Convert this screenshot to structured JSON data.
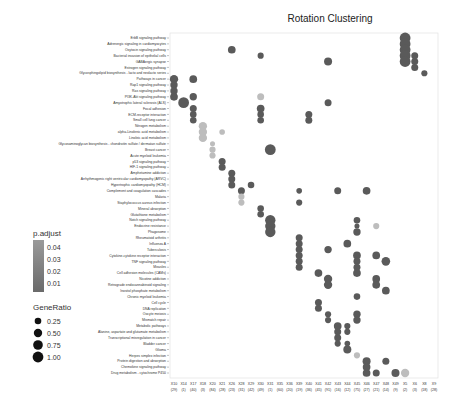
{
  "chart_data": {
    "type": "scatter",
    "title": "Rotation Clustering",
    "xlabel": "",
    "ylabel": "",
    "grid": false,
    "columns": [
      {
        "id": "X10",
        "n": "(29)"
      },
      {
        "id": "X14",
        "n": "(1)"
      },
      {
        "id": "X17",
        "n": "(40)"
      },
      {
        "id": "X18",
        "n": "(3)"
      },
      {
        "id": "X20",
        "n": "(84)"
      },
      {
        "id": "X21",
        "n": "(28)"
      },
      {
        "id": "X26",
        "n": "(23)"
      },
      {
        "id": "X28",
        "n": "(31)"
      },
      {
        "id": "X29",
        "n": "(42)"
      },
      {
        "id": "X30",
        "n": "(49)"
      },
      {
        "id": "X31",
        "n": "(1)"
      },
      {
        "id": "X35",
        "n": "(60)"
      },
      {
        "id": "X36",
        "n": "(20)"
      },
      {
        "id": "X39",
        "n": "(19)"
      },
      {
        "id": "X40",
        "n": "(36)"
      },
      {
        "id": "X41",
        "n": "(45)"
      },
      {
        "id": "X42",
        "n": "(91)"
      },
      {
        "id": "X43",
        "n": "(16)"
      },
      {
        "id": "X44",
        "n": "(12)"
      },
      {
        "id": "X45",
        "n": "(75)"
      },
      {
        "id": "X46",
        "n": "(27)"
      },
      {
        "id": "X47",
        "n": "(21)"
      },
      {
        "id": "X48",
        "n": "(14)"
      },
      {
        "id": "X49",
        "n": "(9)"
      },
      {
        "id": "X5",
        "n": "(2)"
      },
      {
        "id": "X6",
        "n": "(3)"
      },
      {
        "id": "X8",
        "n": "(18)"
      },
      {
        "id": "X9",
        "n": "(28)"
      }
    ],
    "rows": [
      "ErbB signaling pathway",
      "Adrenergic signaling in cardiomyocytes",
      "Oxytocin signaling pathway",
      "Bacterial invasion of epithelial cells",
      "GABAergic synapse",
      "Estrogen signaling pathway",
      "Glycosphingolipid biosynthesis - lacto and neolacto series",
      "Pathways in cancer",
      "Rap1 signaling pathway",
      "Ras signaling pathway",
      "PI3K-Akt signaling pathway",
      "Amyotrophic lateral sclerosis (ALS)",
      "Focal adhesion",
      "ECM-receptor interaction",
      "Small cell lung cancer",
      "Nitrogen metabolism",
      "alpha-Linolenic acid metabolism",
      "Linoleic acid metabolism",
      "Glycosaminoglycan biosynthesis - chondroitin sulfate / dermatan sulfate",
      "Breast cancer",
      "Acute myeloid leukemia",
      "p53 signaling pathway",
      "HIF-1 signaling pathway",
      "Amphetamine addiction",
      "Arrhythmogenic right ventricular cardiomyopathy (ARVC)",
      "Hypertrophic cardiomyopathy (HCM)",
      "Complement and coagulation cascades",
      "Malaria",
      "Staphylococcus aureus infection",
      "Mineral absorption",
      "Glutathione metabolism",
      "Notch signaling pathway",
      "Endocrine resistance",
      "Phagosome",
      "Rheumatoid arthritis",
      "Influenza A",
      "Tuberculosis",
      "Cytokine-cytokine receptor interaction",
      "TNF signaling pathway",
      "Measles",
      "Cell adhesion molecules (CAMs)",
      "Nicotine addiction",
      "Retrograde endocannabinoid signaling",
      "Inositol phosphate metabolism",
      "Chronic myeloid leukemia",
      "Cell cycle",
      "DNA replication",
      "Oocyte meiosis",
      "Mismatch repair",
      "Metabolic pathways",
      "Alanine, aspartate and glutamate metabolism",
      "Transcriptional misregulation in cancer",
      "Bladder cancer",
      "Glioma",
      "Herpes simplex infection",
      "Protein digestion and absorption",
      "Chemokine signaling pathway",
      "Drug metabolism - cytochrome P450"
    ],
    "points": [
      {
        "row": 0,
        "col": 24,
        "ratio": 1.0,
        "p": 0.01
      },
      {
        "row": 1,
        "col": 24,
        "ratio": 1.0,
        "p": 0.01
      },
      {
        "row": 2,
        "col": 24,
        "ratio": 1.0,
        "p": 0.01
      },
      {
        "row": 3,
        "col": 24,
        "ratio": 1.0,
        "p": 0.01
      },
      {
        "row": 4,
        "col": 24,
        "ratio": 1.0,
        "p": 0.01
      },
      {
        "row": 2,
        "col": 6,
        "ratio": 0.4,
        "p": 0.01
      },
      {
        "row": 3,
        "col": 9,
        "ratio": 0.2,
        "p": 0.01
      },
      {
        "row": 4,
        "col": 16,
        "ratio": 0.45,
        "p": 0.01
      },
      {
        "row": 3,
        "col": 25,
        "ratio": 0.3,
        "p": 0.01
      },
      {
        "row": 4,
        "col": 25,
        "ratio": 0.3,
        "p": 0.01
      },
      {
        "row": 5,
        "col": 25,
        "ratio": 0.3,
        "p": 0.01
      },
      {
        "row": 6,
        "col": 26,
        "ratio": 0.2,
        "p": 0.01
      },
      {
        "row": 7,
        "col": 0,
        "ratio": 0.5,
        "p": 0.01
      },
      {
        "row": 7,
        "col": 2,
        "ratio": 0.4,
        "p": 0.01
      },
      {
        "row": 8,
        "col": 0,
        "ratio": 0.35,
        "p": 0.01
      },
      {
        "row": 9,
        "col": 0,
        "ratio": 0.35,
        "p": 0.01
      },
      {
        "row": 10,
        "col": 0,
        "ratio": 0.4,
        "p": 0.01
      },
      {
        "row": 10,
        "col": 2,
        "ratio": 0.35,
        "p": 0.01
      },
      {
        "row": 10,
        "col": 9,
        "ratio": 0.3,
        "p": 0.04
      },
      {
        "row": 11,
        "col": 1,
        "ratio": 1.0,
        "p": 0.01
      },
      {
        "row": 11,
        "col": 16,
        "ratio": 0.3,
        "p": 0.01
      },
      {
        "row": 12,
        "col": 2,
        "ratio": 0.3,
        "p": 0.01
      },
      {
        "row": 12,
        "col": 9,
        "ratio": 0.4,
        "p": 0.01
      },
      {
        "row": 13,
        "col": 2,
        "ratio": 0.25,
        "p": 0.01
      },
      {
        "row": 13,
        "col": 9,
        "ratio": 0.25,
        "p": 0.01
      },
      {
        "row": 13,
        "col": 14,
        "ratio": 0.3,
        "p": 0.01
      },
      {
        "row": 14,
        "col": 2,
        "ratio": 0.25,
        "p": 0.01
      },
      {
        "row": 14,
        "col": 9,
        "ratio": 0.25,
        "p": 0.01
      },
      {
        "row": 14,
        "col": 14,
        "ratio": 0.3,
        "p": 0.01
      },
      {
        "row": 15,
        "col": 3,
        "ratio": 0.5,
        "p": 0.04
      },
      {
        "row": 16,
        "col": 3,
        "ratio": 0.5,
        "p": 0.04
      },
      {
        "row": 17,
        "col": 3,
        "ratio": 0.5,
        "p": 0.04
      },
      {
        "row": 16,
        "col": 5,
        "ratio": 0.15,
        "p": 0.04
      },
      {
        "row": 18,
        "col": 4,
        "ratio": 0.1,
        "p": 0.04
      },
      {
        "row": 19,
        "col": 4,
        "ratio": 0.2,
        "p": 0.04
      },
      {
        "row": 19,
        "col": 10,
        "ratio": 1.0,
        "p": 0.01
      },
      {
        "row": 20,
        "col": 4,
        "ratio": 0.2,
        "p": 0.04
      },
      {
        "row": 21,
        "col": 5,
        "ratio": 0.3,
        "p": 0.01
      },
      {
        "row": 22,
        "col": 5,
        "ratio": 0.3,
        "p": 0.01
      },
      {
        "row": 23,
        "col": 6,
        "ratio": 0.3,
        "p": 0.01
      },
      {
        "row": 24,
        "col": 6,
        "ratio": 0.3,
        "p": 0.01
      },
      {
        "row": 25,
        "col": 6,
        "ratio": 0.3,
        "p": 0.01
      },
      {
        "row": 25,
        "col": 8,
        "ratio": 0.25,
        "p": 0.01
      },
      {
        "row": 26,
        "col": 7,
        "ratio": 0.3,
        "p": 0.01
      },
      {
        "row": 26,
        "col": 13,
        "ratio": 0.15,
        "p": 0.01
      },
      {
        "row": 27,
        "col": 7,
        "ratio": 0.2,
        "p": 0.04
      },
      {
        "row": 28,
        "col": 7,
        "ratio": 0.2,
        "p": 0.04
      },
      {
        "row": 28,
        "col": 13,
        "ratio": 0.2,
        "p": 0.01
      },
      {
        "row": 26,
        "col": 17,
        "ratio": 0.3,
        "p": 0.01
      },
      {
        "row": 26,
        "col": 20,
        "ratio": 0.4,
        "p": 0.01
      },
      {
        "row": 29,
        "col": 9,
        "ratio": 0.25,
        "p": 0.01
      },
      {
        "row": 30,
        "col": 9,
        "ratio": 0.25,
        "p": 0.01
      },
      {
        "row": 31,
        "col": 10,
        "ratio": 0.9,
        "p": 0.01
      },
      {
        "row": 32,
        "col": 10,
        "ratio": 0.9,
        "p": 0.01
      },
      {
        "row": 33,
        "col": 10,
        "ratio": 0.9,
        "p": 0.01
      },
      {
        "row": 31,
        "col": 19,
        "ratio": 0.25,
        "p": 0.01
      },
      {
        "row": 32,
        "col": 19,
        "ratio": 0.1,
        "p": 0.01
      },
      {
        "row": 33,
        "col": 19,
        "ratio": 0.35,
        "p": 0.01
      },
      {
        "row": 32,
        "col": 21,
        "ratio": 0.2,
        "p": 0.04
      },
      {
        "row": 34,
        "col": 13,
        "ratio": 0.3,
        "p": 0.01
      },
      {
        "row": 35,
        "col": 13,
        "ratio": 0.3,
        "p": 0.01
      },
      {
        "row": 36,
        "col": 13,
        "ratio": 0.3,
        "p": 0.01
      },
      {
        "row": 37,
        "col": 13,
        "ratio": 0.3,
        "p": 0.01
      },
      {
        "row": 38,
        "col": 13,
        "ratio": 0.3,
        "p": 0.01
      },
      {
        "row": 39,
        "col": 13,
        "ratio": 0.3,
        "p": 0.01
      },
      {
        "row": 35,
        "col": 18,
        "ratio": 0.4,
        "p": 0.01
      },
      {
        "row": 36,
        "col": 16,
        "ratio": 0.35,
        "p": 0.01
      },
      {
        "row": 37,
        "col": 19,
        "ratio": 0.4,
        "p": 0.01
      },
      {
        "row": 37,
        "col": 21,
        "ratio": 0.4,
        "p": 0.01
      },
      {
        "row": 38,
        "col": 22,
        "ratio": 0.55,
        "p": 0.01
      },
      {
        "row": 38,
        "col": 19,
        "ratio": 0.3,
        "p": 0.01
      },
      {
        "row": 39,
        "col": 19,
        "ratio": 0.3,
        "p": 0.01
      },
      {
        "row": 40,
        "col": 19,
        "ratio": 0.4,
        "p": 0.01
      },
      {
        "row": 40,
        "col": 15,
        "ratio": 0.4,
        "p": 0.01
      },
      {
        "row": 41,
        "col": 16,
        "ratio": 0.5,
        "p": 0.01
      },
      {
        "row": 42,
        "col": 16,
        "ratio": 0.5,
        "p": 0.01
      },
      {
        "row": 41,
        "col": 21,
        "ratio": 0.4,
        "p": 0.01
      },
      {
        "row": 42,
        "col": 21,
        "ratio": 0.4,
        "p": 0.01
      },
      {
        "row": 43,
        "col": 22,
        "ratio": 0.4,
        "p": 0.01
      },
      {
        "row": 44,
        "col": 19,
        "ratio": 0.25,
        "p": 0.01
      },
      {
        "row": 45,
        "col": 15,
        "ratio": 0.3,
        "p": 0.01
      },
      {
        "row": 46,
        "col": 15,
        "ratio": 0.3,
        "p": 0.01
      },
      {
        "row": 47,
        "col": 16,
        "ratio": 0.2,
        "p": 0.01
      },
      {
        "row": 48,
        "col": 16,
        "ratio": 0.2,
        "p": 0.01
      },
      {
        "row": 47,
        "col": 19,
        "ratio": 0.35,
        "p": 0.01
      },
      {
        "row": 48,
        "col": 19,
        "ratio": 0.35,
        "p": 0.01
      },
      {
        "row": 49,
        "col": 17,
        "ratio": 0.4,
        "p": 0.01
      },
      {
        "row": 50,
        "col": 17,
        "ratio": 0.3,
        "p": 0.01
      },
      {
        "row": 51,
        "col": 17,
        "ratio": 0.3,
        "p": 0.01
      },
      {
        "row": 52,
        "col": 17,
        "ratio": 0.2,
        "p": 0.01
      },
      {
        "row": 49,
        "col": 18,
        "ratio": 0.2,
        "p": 0.01
      },
      {
        "row": 50,
        "col": 18,
        "ratio": 0.2,
        "p": 0.01
      },
      {
        "row": 52,
        "col": 18,
        "ratio": 0.15,
        "p": 0.01
      },
      {
        "row": 53,
        "col": 18,
        "ratio": 0.45,
        "p": 0.01
      },
      {
        "row": 54,
        "col": 19,
        "ratio": 0.2,
        "p": 0.04
      },
      {
        "row": 55,
        "col": 20,
        "ratio": 0.45,
        "p": 0.01
      },
      {
        "row": 56,
        "col": 20,
        "ratio": 0.4,
        "p": 0.01
      },
      {
        "row": 57,
        "col": 20,
        "ratio": 0.4,
        "p": 0.01
      },
      {
        "row": 55,
        "col": 22,
        "ratio": 0.3,
        "p": 0.01
      },
      {
        "row": 57,
        "col": 21,
        "ratio": 0.3,
        "p": 0.01
      },
      {
        "row": 57,
        "col": 23,
        "ratio": 0.45,
        "p": 0.01
      },
      {
        "row": 57,
        "col": 24,
        "ratio": 0.5,
        "p": 0.04
      }
    ],
    "legend": {
      "color_title": "p.adjust",
      "color_ticks": [
        "0.04",
        "0.03",
        "0.02",
        "0.01"
      ],
      "size_title": "GeneRatio",
      "size_ticks": [
        "0.25",
        "0.50",
        "0.75",
        "1.00"
      ],
      "placement": "left"
    },
    "colors": {
      "low_p": "#5a5a5a",
      "high_p": "#bdbdbd",
      "frame": "#cccccc"
    }
  }
}
